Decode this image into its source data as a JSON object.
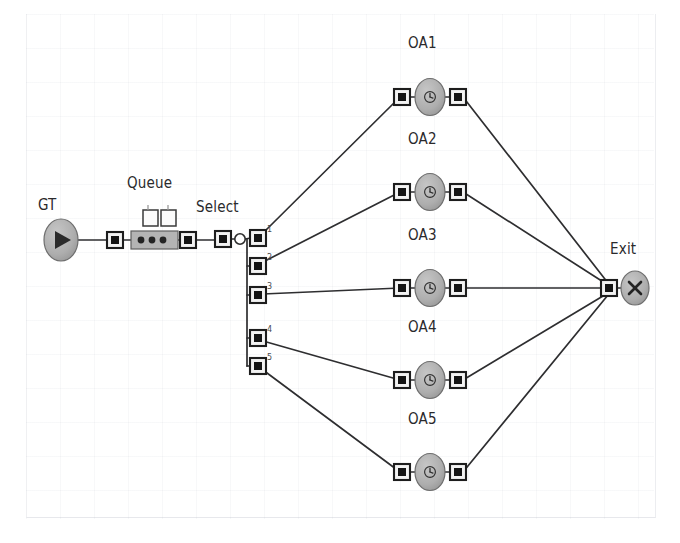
{
  "diagram": {
    "type": "simulation-process-flow",
    "title": "",
    "background": "#ffffff",
    "node_fill": "#b0b0b0",
    "node_stroke": "#6a6a6a",
    "link_color": "#333333",
    "port_fill": "#1c1c1c",
    "port_border": "#e8e8e8",
    "label_color": "#2a2a2c"
  },
  "labels": {
    "source": "GT",
    "queue": "Queue",
    "select": "Select",
    "exit": "Exit",
    "activities": [
      "OA1",
      "OA2",
      "OA3",
      "OA4",
      "OA5"
    ]
  },
  "nodes": [
    {
      "id": "gt",
      "name": "GT",
      "shape": "oval",
      "glyph": "play-triangle",
      "x": 61,
      "y": 240
    },
    {
      "id": "queue",
      "name": "Queue",
      "shape": "queue-bar",
      "glyph": "three-dots",
      "x": 155,
      "y": 240
    },
    {
      "id": "select",
      "name": "Select",
      "shape": "small-circle",
      "glyph": "hollow-circle",
      "x": 240,
      "y": 239
    },
    {
      "id": "oa1",
      "name": "OA1",
      "shape": "oval",
      "glyph": "clock",
      "x": 430,
      "y": 97
    },
    {
      "id": "oa2",
      "name": "OA2",
      "shape": "oval",
      "glyph": "clock",
      "x": 430,
      "y": 192
    },
    {
      "id": "oa3",
      "name": "OA3",
      "shape": "oval",
      "glyph": "clock",
      "x": 430,
      "y": 288
    },
    {
      "id": "oa4",
      "name": "OA4",
      "shape": "oval",
      "glyph": "clock",
      "x": 430,
      "y": 380
    },
    {
      "id": "oa5",
      "name": "OA5",
      "shape": "oval",
      "glyph": "clock",
      "x": 430,
      "y": 472
    },
    {
      "id": "exit",
      "name": "Exit",
      "shape": "oval",
      "glyph": "x-cross",
      "x": 633,
      "y": 288
    }
  ],
  "select_branches": [
    {
      "index": "1",
      "y": 238
    },
    {
      "index": "2",
      "y": 266
    },
    {
      "index": "3",
      "y": 295
    },
    {
      "index": "4",
      "y": 338
    },
    {
      "index": "5",
      "y": 366
    }
  ],
  "connections": [
    {
      "from": "GT",
      "to": "Queue",
      "style": "straight"
    },
    {
      "from": "Queue",
      "to": "Select",
      "style": "straight"
    },
    {
      "from": "Select.1",
      "to": "OA1",
      "style": "straight"
    },
    {
      "from": "Select.2",
      "to": "OA2",
      "style": "straight"
    },
    {
      "from": "Select.3",
      "to": "OA3",
      "style": "straight"
    },
    {
      "from": "Select.4",
      "to": "OA4",
      "style": "straight"
    },
    {
      "from": "Select.5",
      "to": "OA5",
      "style": "straight"
    },
    {
      "from": "OA1",
      "to": "Exit",
      "style": "straight"
    },
    {
      "from": "OA2",
      "to": "Exit",
      "style": "straight"
    },
    {
      "from": "OA3",
      "to": "Exit",
      "style": "straight"
    },
    {
      "from": "OA4",
      "to": "Exit",
      "style": "straight"
    },
    {
      "from": "OA5",
      "to": "Exit",
      "style": "straight"
    }
  ]
}
